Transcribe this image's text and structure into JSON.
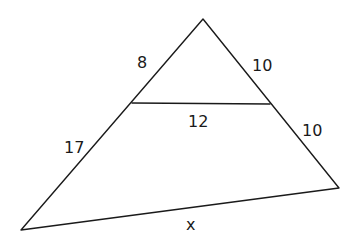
{
  "diagram": {
    "type": "triangle-with-midsegment",
    "labels": {
      "upper_left": "8",
      "upper_right": "10",
      "midsegment": "12",
      "lower_right": "10",
      "lower_left": "17",
      "base": "x"
    }
  }
}
